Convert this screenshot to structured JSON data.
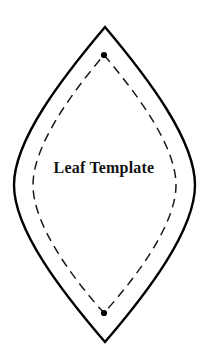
{
  "page": {
    "title": "Leaf Template",
    "background_color": "#ffffff",
    "width": 208,
    "height": 364
  },
  "label": {
    "text": "Leaf Template",
    "color": "#121212",
    "center_x": 104,
    "baseline_y": 176
  },
  "shape": {
    "name": "leaf-template",
    "outline": {
      "style": "solid",
      "stroke_color": "#000000",
      "stroke_width": 2.4,
      "fill": "none",
      "apex_top": [
        105,
        27
      ],
      "apex_bottom": [
        105,
        342
      ],
      "left_extreme": [
        14,
        185
      ],
      "right_extreme": [
        195,
        185
      ],
      "path": "M 105 27 C 148 78 195 140 195 185 C 195 230 148 292 105 342 C 62 292 14 230 14 185 C 14 140 62 78 105 27 Z"
    },
    "inner_guide": {
      "style": "dashed",
      "stroke_color": "#1a1a1a",
      "stroke_width": 1.5,
      "dash_array": "9 6",
      "fill": "none",
      "apex_top": [
        104,
        55
      ],
      "apex_bottom": [
        104,
        313
      ],
      "left_extreme": [
        33,
        185
      ],
      "right_extreme": [
        176,
        185
      ],
      "path": "M 104 55 C 139 96 176 147 176 185 C 176 223 139 274 104 313 C 69 274 33 223 33 185 C 33 147 69 96 104 55 Z"
    },
    "markers": [
      {
        "name": "top-vertex-dot",
        "cx": 104,
        "cy": 55,
        "r": 3.1,
        "color": "#000000"
      },
      {
        "name": "bottom-vertex-dot",
        "cx": 104,
        "cy": 313,
        "r": 3.1,
        "color": "#000000"
      }
    ]
  }
}
